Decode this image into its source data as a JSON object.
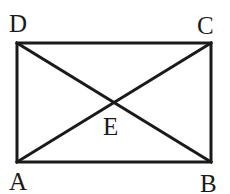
{
  "diagram": {
    "type": "rectangle-with-diagonals",
    "stroke_color": "#1a1a1a",
    "background": "#ffffff",
    "points": {
      "A": {
        "label": "A",
        "x": 17,
        "y": 162
      },
      "B": {
        "label": "B",
        "x": 211,
        "y": 162
      },
      "C": {
        "label": "C",
        "x": 211,
        "y": 43
      },
      "D": {
        "label": "D",
        "x": 17,
        "y": 43
      },
      "E": {
        "label": "E",
        "x": 114,
        "y": 103
      }
    },
    "segments": [
      "AB",
      "BC",
      "CD",
      "DA",
      "AC",
      "BD"
    ],
    "labels": {
      "A": "A",
      "B": "B",
      "C": "C",
      "D": "D",
      "E": "E"
    }
  }
}
